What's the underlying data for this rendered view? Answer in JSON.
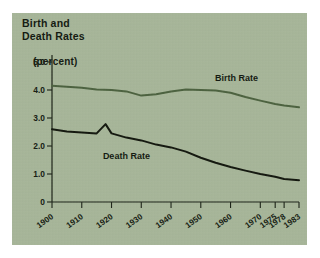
{
  "figure": {
    "title": "Birth and\nDeath Rates",
    "subtitle": "(percent)",
    "background_color": "#a8b79a",
    "birth_color": "#4d6340",
    "death_color": "#14180f"
  },
  "chart_data": {
    "type": "line",
    "title": "Birth and Death Rates (percent)",
    "xlabel": "",
    "ylabel": "percent",
    "grid": false,
    "legend": "inline-annotations",
    "xlim": [
      1900,
      1983
    ],
    "ylim": [
      0,
      5.0
    ],
    "ytick_labels": [
      "5.0",
      "4.0",
      "3.0",
      "2.0",
      "1.0",
      "0"
    ],
    "ytick_values": [
      5.0,
      4.0,
      3.0,
      2.0,
      1.0,
      0
    ],
    "xtick_labels": [
      "1900",
      "1910",
      "1920",
      "1930",
      "1940",
      "1950",
      "1960",
      "1970",
      "1975",
      "1978",
      "1983"
    ],
    "xtick_values": [
      1900,
      1910,
      1920,
      1930,
      1940,
      1950,
      1960,
      1970,
      1975,
      1978,
      1983
    ],
    "series": [
      {
        "name": "Birth Rate",
        "color": "#4d6340",
        "x": [
          1900,
          1905,
          1910,
          1915,
          1920,
          1925,
          1930,
          1935,
          1940,
          1945,
          1950,
          1955,
          1960,
          1965,
          1970,
          1975,
          1978,
          1983
        ],
        "values": [
          4.15,
          4.12,
          4.08,
          4.02,
          4.0,
          3.95,
          3.8,
          3.85,
          3.95,
          4.02,
          4.0,
          3.98,
          3.9,
          3.75,
          3.62,
          3.5,
          3.45,
          3.38
        ]
      },
      {
        "name": "Death Rate",
        "color": "#14180f",
        "x": [
          1900,
          1905,
          1910,
          1915,
          1918,
          1920,
          1925,
          1930,
          1935,
          1940,
          1945,
          1950,
          1955,
          1960,
          1965,
          1970,
          1975,
          1978,
          1983
        ],
        "values": [
          2.6,
          2.52,
          2.48,
          2.45,
          2.78,
          2.45,
          2.3,
          2.2,
          2.05,
          1.95,
          1.8,
          1.58,
          1.4,
          1.25,
          1.12,
          1.0,
          0.9,
          0.82,
          0.78
        ]
      }
    ],
    "annotations": [
      {
        "text": "Birth Rate",
        "x": 1962,
        "y": 4.32
      },
      {
        "text": "Death Rate",
        "x": 1925,
        "y": 1.52
      }
    ]
  }
}
